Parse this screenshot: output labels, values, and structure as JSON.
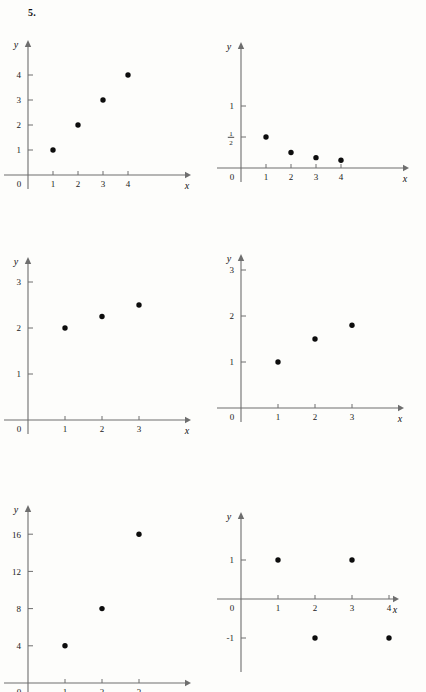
{
  "page": {
    "problem_label": "5.",
    "background_color": "#fdfdfb",
    "axis_color": "#6e6e6e",
    "point_color": "#0d0d0d"
  },
  "charts": [
    {
      "id": "plot-a",
      "type": "scatter",
      "title": "",
      "xlabel": "x",
      "ylabel": "y",
      "origin_label": "0",
      "x": [
        1,
        2,
        3,
        4
      ],
      "values": [
        1,
        2,
        3,
        4
      ],
      "xticks": [
        "1",
        "2",
        "3",
        "4"
      ],
      "yticks": [
        "1",
        "2",
        "3",
        "4"
      ],
      "xlim": [
        0,
        5.6
      ],
      "ylim": [
        0,
        5.2
      ],
      "grid": false,
      "legend": "none"
    },
    {
      "id": "plot-b",
      "type": "scatter",
      "title": "",
      "xlabel": "x",
      "ylabel": "y",
      "origin_label": "0",
      "x": [
        1,
        2,
        3,
        4
      ],
      "values": [
        0.5,
        0.25,
        0.167,
        0.125
      ],
      "xticks": [
        "1",
        "2",
        "3",
        "4"
      ],
      "yticks": [
        "1/2",
        "1"
      ],
      "ytick_values": [
        0.5,
        1
      ],
      "xlim": [
        0,
        6.4
      ],
      "ylim": [
        0,
        1.6
      ],
      "grid": false,
      "legend": "none"
    },
    {
      "id": "plot-c",
      "type": "scatter",
      "title": "",
      "xlabel": "x",
      "ylabel": "y",
      "origin_label": "0",
      "x": [
        1,
        2,
        3
      ],
      "values": [
        2,
        2.25,
        2.5
      ],
      "xticks": [
        "1",
        "2",
        "3"
      ],
      "yticks": [
        "1",
        "2",
        "3"
      ],
      "xlim": [
        0,
        4.7
      ],
      "ylim": [
        0,
        3.9
      ],
      "grid": false,
      "legend": "none"
    },
    {
      "id": "plot-d",
      "type": "scatter",
      "title": "",
      "xlabel": "x",
      "ylabel": "y",
      "origin_label": "0",
      "x": [
        1,
        2,
        3
      ],
      "values": [
        1,
        1.5,
        1.8
      ],
      "xticks": [
        "1",
        "2",
        "3"
      ],
      "yticks": [
        "1",
        "2",
        "3"
      ],
      "xlim": [
        0,
        4.8
      ],
      "ylim": [
        0,
        3.9
      ],
      "grid": false,
      "legend": "none"
    },
    {
      "id": "plot-e",
      "type": "scatter",
      "title": "",
      "xlabel": "x",
      "ylabel": "y",
      "origin_label": "0",
      "x": [
        1,
        2,
        3
      ],
      "values": [
        4,
        8,
        16
      ],
      "xticks": [
        "1",
        "2",
        "3"
      ],
      "yticks": [
        "4",
        "8",
        "12",
        "16"
      ],
      "xlim": [
        0,
        4.7
      ],
      "ylim": [
        0,
        20
      ],
      "grid": false,
      "legend": "none"
    },
    {
      "id": "plot-f",
      "type": "scatter",
      "title": "",
      "xlabel": "x",
      "ylabel": "y",
      "origin_label": "0",
      "x": [
        1,
        2,
        3,
        4
      ],
      "values": [
        1,
        -1,
        1,
        -1
      ],
      "xticks": [
        "1",
        "2",
        "3",
        "4"
      ],
      "yticks": [
        "1",
        "-1"
      ],
      "ytick_values": [
        1,
        -1
      ],
      "xlim": [
        0,
        5.6
      ],
      "ylim": [
        -2.1,
        2.3
      ],
      "grid": false,
      "legend": "none"
    }
  ],
  "chart_data": [
    {
      "type": "scatter",
      "title": "",
      "xlabel": "x",
      "ylabel": "y",
      "x": [
        1,
        2,
        3,
        4
      ],
      "values": [
        1,
        2,
        3,
        4
      ],
      "xlim": [
        0,
        5.6
      ],
      "ylim": [
        0,
        5.2
      ],
      "xticks": [
        1,
        2,
        3,
        4
      ],
      "yticks": [
        1,
        2,
        3,
        4
      ],
      "grid": false,
      "legend": "none"
    },
    {
      "type": "scatter",
      "title": "",
      "xlabel": "x",
      "ylabel": "y",
      "x": [
        1,
        2,
        3,
        4
      ],
      "values": [
        0.5,
        0.25,
        0.167,
        0.125
      ],
      "xlim": [
        0,
        6.4
      ],
      "ylim": [
        0,
        1.6
      ],
      "xticks": [
        1,
        2,
        3,
        4
      ],
      "yticks": [
        0.5,
        1
      ],
      "ytick_labels": [
        "1/2",
        "1"
      ],
      "grid": false,
      "legend": "none"
    },
    {
      "type": "scatter",
      "title": "",
      "xlabel": "x",
      "ylabel": "y",
      "x": [
        1,
        2,
        3
      ],
      "values": [
        2,
        2.25,
        2.5
      ],
      "xlim": [
        0,
        4.7
      ],
      "ylim": [
        0,
        3.9
      ],
      "xticks": [
        1,
        2,
        3
      ],
      "yticks": [
        1,
        2,
        3
      ],
      "grid": false,
      "legend": "none"
    },
    {
      "type": "scatter",
      "title": "",
      "xlabel": "x",
      "ylabel": "y",
      "x": [
        1,
        2,
        3
      ],
      "values": [
        1,
        1.5,
        1.8
      ],
      "xlim": [
        0,
        4.8
      ],
      "ylim": [
        0,
        3.9
      ],
      "xticks": [
        1,
        2,
        3
      ],
      "yticks": [
        1,
        2,
        3
      ],
      "grid": false,
      "legend": "none"
    },
    {
      "type": "scatter",
      "title": "",
      "xlabel": "x",
      "ylabel": "y",
      "x": [
        1,
        2,
        3
      ],
      "values": [
        4,
        8,
        16
      ],
      "xlim": [
        0,
        4.7
      ],
      "ylim": [
        0,
        20
      ],
      "xticks": [
        1,
        2,
        3
      ],
      "yticks": [
        4,
        8,
        12,
        16
      ],
      "grid": false,
      "legend": "none"
    },
    {
      "type": "scatter",
      "title": "",
      "xlabel": "x",
      "ylabel": "y",
      "x": [
        1,
        2,
        3,
        4
      ],
      "values": [
        1,
        -1,
        1,
        -1
      ],
      "xlim": [
        0,
        5.6
      ],
      "ylim": [
        -2.1,
        2.3
      ],
      "xticks": [
        1,
        2,
        3,
        4
      ],
      "yticks": [
        1,
        -1
      ],
      "grid": false,
      "legend": "none"
    }
  ]
}
